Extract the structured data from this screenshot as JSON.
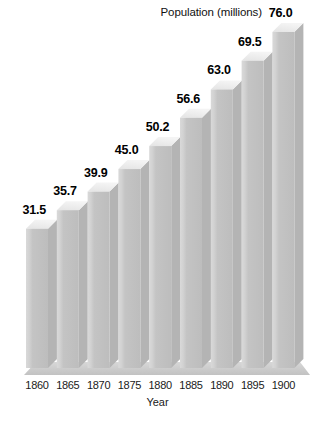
{
  "chart_data": {
    "type": "bar",
    "title": "Population (millions)",
    "xlabel": "Year",
    "ylabel": "Population (millions)",
    "categories": [
      "1860",
      "1865",
      "1870",
      "1875",
      "1880",
      "1885",
      "1890",
      "1895",
      "1900"
    ],
    "values": [
      31.5,
      35.7,
      39.9,
      45.0,
      50.2,
      56.6,
      63.0,
      69.5,
      76.0
    ],
    "value_labels": [
      "31.5",
      "35.7",
      "39.9",
      "45.0",
      "50.2",
      "56.6",
      "63.0",
      "69.5",
      "76.0"
    ],
    "ylim": [
      0,
      76.0
    ],
    "grid": false,
    "legend": false,
    "style": "3d-extruded-bars",
    "colors": {
      "bar_front": "#c3c3c3",
      "bar_front_highlight": "#d6d6d6",
      "bar_top": "#eeeeee",
      "bar_side": "#b4b4b4",
      "floor": "#c9c9c9",
      "floor_top": "#d5d5d5",
      "label_text": "#000000",
      "background": "#ffffff"
    }
  }
}
